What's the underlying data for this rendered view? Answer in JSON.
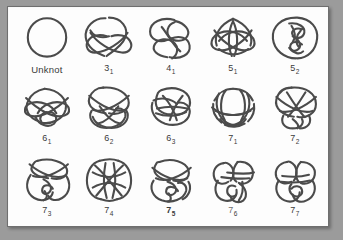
{
  "figure": {
    "kind": "knot-table",
    "rows": 3,
    "columns": 5,
    "colors": {
      "surround": "#9b9b9b",
      "paper": "#fdfdfd",
      "frame": "#6f6f6f",
      "ink": "#4b4b4b",
      "label": "#3a3a3a"
    }
  },
  "rows": [
    {
      "index": 1,
      "cells": [
        {
          "id": "unknot",
          "label": "Unknot",
          "main": "Unknot",
          "sub": "",
          "crossings": 0,
          "style": "word"
        },
        {
          "id": "3_1",
          "label": "3 1",
          "main": "3",
          "sub": "1",
          "crossings": 3,
          "style": "normal"
        },
        {
          "id": "4_1",
          "label": "4 1",
          "main": "4",
          "sub": "1",
          "crossings": 4,
          "style": "normal"
        },
        {
          "id": "5_1",
          "label": "5 1",
          "main": "5",
          "sub": "1",
          "crossings": 5,
          "style": "normal"
        },
        {
          "id": "5_2",
          "label": "5 2",
          "main": "5",
          "sub": "2",
          "crossings": 5,
          "style": "normal"
        }
      ]
    },
    {
      "index": 2,
      "cells": [
        {
          "id": "6_1",
          "label": "6 1",
          "main": "6",
          "sub": "1",
          "crossings": 6,
          "style": "normal"
        },
        {
          "id": "6_2",
          "label": "6 2",
          "main": "6",
          "sub": "2",
          "crossings": 6,
          "style": "normal"
        },
        {
          "id": "6_3",
          "label": "6 3",
          "main": "6",
          "sub": "3",
          "crossings": 6,
          "style": "normal"
        },
        {
          "id": "7_1",
          "label": "7 1",
          "main": "7",
          "sub": "1",
          "crossings": 7,
          "style": "normal"
        },
        {
          "id": "7_2",
          "label": "7 2",
          "main": "7",
          "sub": "2",
          "crossings": 7,
          "style": "normal"
        }
      ]
    },
    {
      "index": 3,
      "cells": [
        {
          "id": "7_3",
          "label": "7 3",
          "main": "7",
          "sub": "3",
          "crossings": 7,
          "style": "normal"
        },
        {
          "id": "7_4",
          "label": "7 4",
          "main": "7",
          "sub": "4",
          "crossings": 7,
          "style": "normal"
        },
        {
          "id": "7_5",
          "label": "7 5",
          "main": "7",
          "sub": "5",
          "crossings": 7,
          "style": "bold"
        },
        {
          "id": "7_6",
          "label": "7 6",
          "main": "7",
          "sub": "6",
          "crossings": 7,
          "style": "faded"
        },
        {
          "id": "7_7",
          "label": "7 7",
          "main": "7",
          "sub": "7",
          "crossings": 7,
          "style": "normal"
        }
      ]
    }
  ]
}
